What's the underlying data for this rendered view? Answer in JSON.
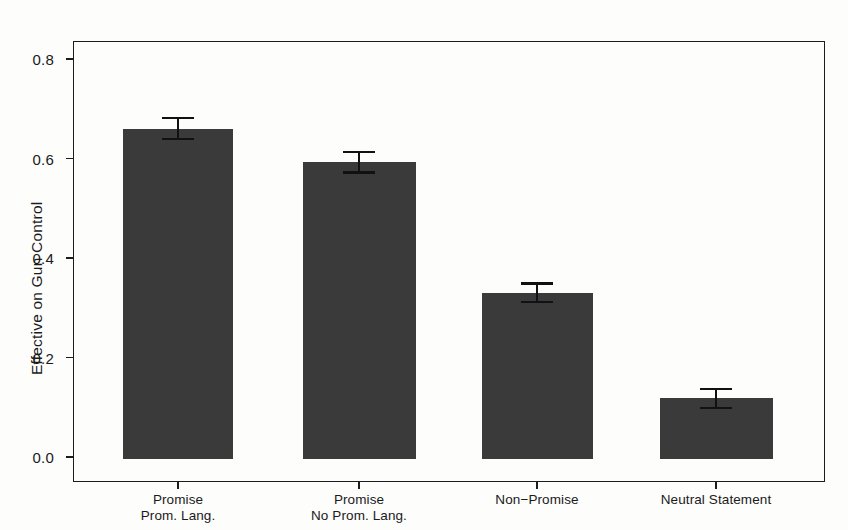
{
  "chart_data": {
    "type": "bar",
    "title": "",
    "subtitle": "",
    "xlabel": "",
    "ylabel": "Effective on Gun Control",
    "ylim": [
      0.0,
      0.84
    ],
    "yticks": [
      0.0,
      0.2,
      0.4,
      0.6,
      0.8
    ],
    "ytick_labels": [
      "0.0",
      "0.2",
      "0.4",
      "0.6",
      "0.8"
    ],
    "grid": false,
    "legend": "none",
    "categories": [
      "Promise Prom. Lang.",
      "Promise No Prom. Lang.",
      "Non−Promise",
      "Neutral Statement"
    ],
    "category_lines": [
      [
        "Promise",
        "Prom. Lang."
      ],
      [
        "Promise",
        "No Prom. Lang."
      ],
      [
        "Non−Promise"
      ],
      [
        "Neutral Statement"
      ]
    ],
    "values": [
      0.66,
      0.593,
      0.33,
      0.118
    ],
    "errors": [
      0.021,
      0.021,
      0.019,
      0.019
    ],
    "error_low": [
      0.639,
      0.572,
      0.311,
      0.099
    ],
    "error_high": [
      0.681,
      0.614,
      0.349,
      0.137
    ],
    "bar_color": "#3a3a3a",
    "error_bar_color": "#111111",
    "axis_color": "#1c1c1c",
    "background_color": "#fdfdfc"
  }
}
